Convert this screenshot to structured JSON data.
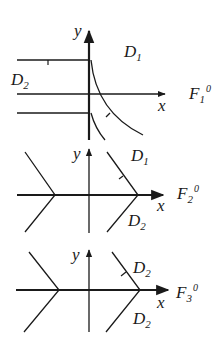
{
  "panels": [
    {
      "id": "F1",
      "axis_x_label": "x",
      "axis_y_label": "y",
      "field_label": "F",
      "field_sub": "1",
      "field_sup": "0",
      "regions": [
        {
          "label": "D",
          "sub": "1"
        },
        {
          "label": "D",
          "sub": "2"
        }
      ]
    },
    {
      "id": "F2",
      "axis_x_label": "x",
      "axis_y_label": "y",
      "field_label": "F",
      "field_sub": "2",
      "field_sup": "0",
      "regions": [
        {
          "label": "D",
          "sub": "1"
        },
        {
          "label": "D",
          "sub": "2"
        }
      ]
    },
    {
      "id": "F3",
      "axis_x_label": "x",
      "axis_y_label": "y",
      "field_label": "F",
      "field_sub": "3",
      "field_sup": "0",
      "regions": [
        {
          "label": "D",
          "sub": "2"
        },
        {
          "label": "D",
          "sub": "2"
        }
      ]
    }
  ],
  "colors": {
    "ink": "#1a1a1a",
    "background": "#ffffff"
  }
}
